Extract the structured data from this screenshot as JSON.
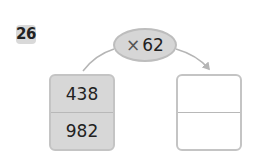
{
  "problem": {
    "number": "26",
    "operator_symbol": "×",
    "operand": "62",
    "inputs": [
      "438",
      "982"
    ],
    "outputs": [
      "",
      ""
    ]
  },
  "colors": {
    "fill_gray": "#d7d7d7",
    "border_gray": "#c4c4c4",
    "arc_gray": "#b5b5b5"
  }
}
